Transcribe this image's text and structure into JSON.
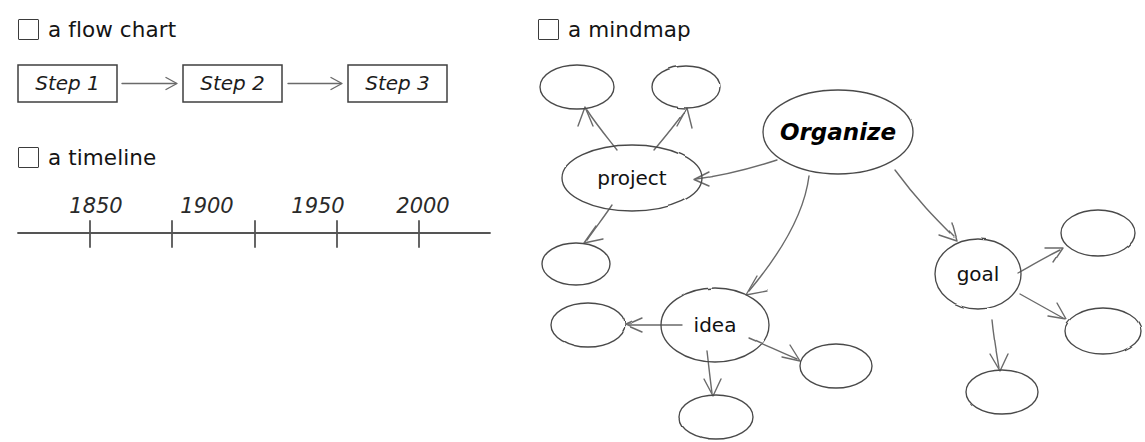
{
  "page": {
    "background_color": "#ffffff",
    "ink_color": "#4a4a4a",
    "text_color": "#141414"
  },
  "sections": [
    {
      "id": "flowchart",
      "checkbox_state": "unchecked",
      "caption": "a flow chart"
    },
    {
      "id": "timeline",
      "checkbox_state": "unchecked",
      "caption": "a timeline"
    },
    {
      "id": "mindmap",
      "checkbox_state": "unchecked",
      "caption": "a mindmap"
    }
  ],
  "flowchart": {
    "caption": "a flow chart",
    "steps": [
      {
        "label": "Step 1"
      },
      {
        "label": "Step 2"
      },
      {
        "label": "Step 3"
      }
    ],
    "connectors": 2,
    "connector_style": "arrow"
  },
  "timeline": {
    "caption": "a timeline",
    "tick_count": 5,
    "labels": [
      "1850",
      "1900",
      "1950",
      "2000"
    ],
    "axis_start": 18,
    "axis_end": 490
  },
  "mindmap": {
    "caption": "a mindmap",
    "root": {
      "label": "Organize",
      "style": "bold-italic"
    },
    "nodes": [
      {
        "label": "Organize",
        "kind": "root"
      },
      {
        "label": "project",
        "kind": "branch"
      },
      {
        "label": "idea",
        "kind": "branch"
      },
      {
        "label": "goal",
        "kind": "branch"
      },
      {
        "label": "",
        "kind": "leaf"
      },
      {
        "label": "",
        "kind": "leaf"
      },
      {
        "label": "",
        "kind": "leaf"
      },
      {
        "label": "",
        "kind": "leaf"
      },
      {
        "label": "",
        "kind": "leaf"
      },
      {
        "label": "",
        "kind": "leaf"
      },
      {
        "label": "",
        "kind": "leaf"
      },
      {
        "label": "",
        "kind": "leaf"
      },
      {
        "label": "",
        "kind": "leaf"
      }
    ],
    "edges": [
      {
        "from": "Organize",
        "to": "project"
      },
      {
        "from": "Organize",
        "to": "idea"
      },
      {
        "from": "Organize",
        "to": "goal"
      },
      {
        "from": "project",
        "to": ""
      },
      {
        "from": "project",
        "to": ""
      },
      {
        "from": "project",
        "to": ""
      },
      {
        "from": "idea",
        "to": ""
      },
      {
        "from": "idea",
        "to": ""
      },
      {
        "from": "idea",
        "to": ""
      },
      {
        "from": "goal",
        "to": ""
      },
      {
        "from": "goal",
        "to": ""
      },
      {
        "from": "goal",
        "to": ""
      }
    ],
    "empty_node_count": 9,
    "labeled_node_count": 4
  }
}
